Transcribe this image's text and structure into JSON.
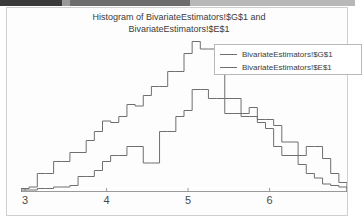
{
  "window": {
    "chrome_strip": true
  },
  "chart": {
    "title": "Histogram of BivariateEstimators!$G$1 and\nBivariateEstimators!$E$1",
    "line_color": "#6f6f6f",
    "axis_color": "#9a9a9a",
    "text_color": "#3b3b3b",
    "background": "#fdfdfd"
  },
  "legend": {
    "entries": [
      {
        "label": "BivariateEstimators!$G$1",
        "color": "#6f6f6f"
      },
      {
        "label": "BivariateEstimators!$E$1",
        "color": "#6f6f6f"
      }
    ]
  },
  "axis": {
    "x_ticks": [
      {
        "label": "3",
        "value": 3
      },
      {
        "label": "4",
        "value": 4
      },
      {
        "label": "5",
        "value": 5
      },
      {
        "label": "6",
        "value": 6
      }
    ]
  },
  "chart_data": {
    "type": "line",
    "title": "Histogram of BivariateEstimators!$G$1 and BivariateEstimators!$E$1",
    "xlabel": "",
    "ylabel": "",
    "xlim": [
      2.95,
      6.95
    ],
    "ylim": [
      0,
      100
    ],
    "grid": false,
    "legend_position": "top-right",
    "bin_width": 0.1,
    "bin_starts": [
      2.95,
      3.05,
      3.15,
      3.25,
      3.35,
      3.45,
      3.55,
      3.65,
      3.75,
      3.85,
      3.95,
      4.05,
      4.15,
      4.25,
      4.35,
      4.45,
      4.55,
      4.65,
      4.75,
      4.85,
      4.95,
      5.05,
      5.15,
      5.25,
      5.35,
      5.45,
      5.55,
      5.65,
      5.75,
      5.85,
      5.95,
      6.05,
      6.15,
      6.25,
      6.35,
      6.45,
      6.55,
      6.65,
      6.75,
      6.85
    ],
    "series": [
      {
        "name": "BivariateEstimators!$G$1",
        "counts": [
          2,
          3,
          12,
          12,
          20,
          20,
          26,
          26,
          34,
          40,
          47,
          46,
          50,
          58,
          57,
          64,
          70,
          70,
          80,
          80,
          92,
          100,
          95,
          95,
          90,
          62,
          62,
          50,
          50,
          46,
          42,
          30,
          24,
          24,
          18,
          12,
          9,
          5,
          4,
          3
        ]
      },
      {
        "name": "BivariateEstimators!$E$1",
        "counts": [
          1,
          1,
          2,
          2,
          3,
          3,
          4,
          10,
          10,
          14,
          20,
          24,
          24,
          30,
          30,
          19,
          19,
          40,
          40,
          50,
          54,
          68,
          68,
          62,
          62,
          52,
          52,
          52,
          56,
          48,
          48,
          44,
          33,
          33,
          24,
          30,
          30,
          22,
          12,
          6
        ]
      }
    ]
  }
}
